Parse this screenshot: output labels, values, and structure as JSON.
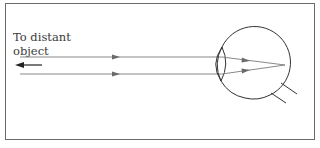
{
  "diagram": {
    "label_line1": "To distant",
    "label_line2": "object",
    "colors": {
      "border": "#6a6a6a",
      "ray": "#7a7a7a",
      "eye_outline": "#333333",
      "text": "#3a3a3a"
    }
  }
}
